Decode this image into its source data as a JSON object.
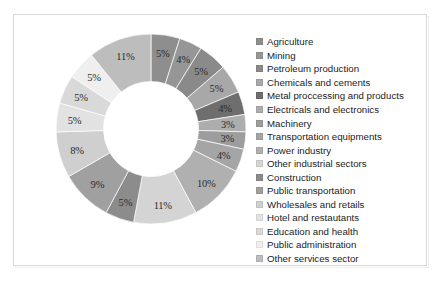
{
  "chart_data": {
    "type": "pie",
    "variant": "donut",
    "title": "",
    "xlabel": "",
    "ylabel": "",
    "legend_position": "right",
    "grid": false,
    "start_angle_deg": 0,
    "direction": "clockwise",
    "inner_radius_ratio": 0.5,
    "value_suffix": "%",
    "categories": [
      "Agriculture",
      "Mining",
      "Petroleum production",
      "Chemicals and cements",
      "Metal proccessing and products",
      "Electricals and electronics",
      "Machinery",
      "Transportation equipments",
      "Power industry",
      "Other industrial sectors",
      "Construction",
      "Public transportation",
      "Wholesales and retails",
      "Hotel and restautants",
      "Education and health",
      "Public administration",
      "Other services sector"
    ],
    "values": [
      5,
      4,
      5,
      5,
      4,
      3,
      3,
      4,
      10,
      11,
      5,
      9,
      8,
      5,
      5,
      5,
      11
    ],
    "labels": [
      "5%",
      "4%",
      "5%",
      "5%",
      "4%",
      "3%",
      "3%",
      "4%",
      "10%",
      "11%",
      "5%",
      "9%",
      "8%",
      "5%",
      "5%",
      "5%",
      "11%"
    ],
    "colors": [
      "#8e8e8e",
      "#969696",
      "#8a8a8a",
      "#a8a8a8",
      "#6e6e6e",
      "#adadad",
      "#9d9d9d",
      "#a5a5a5",
      "#b0b0b0",
      "#d4d4d4",
      "#8c8c8c",
      "#a0a0a0",
      "#cfcfcf",
      "#e2e2e2",
      "#d9d9d9",
      "#efefef",
      "#bdbdbd"
    ]
  },
  "legend": {
    "items": [
      {
        "label": "Agriculture",
        "color": "#8e8e8e"
      },
      {
        "label": "Mining",
        "color": "#969696"
      },
      {
        "label": "Petroleum production",
        "color": "#8a8a8a"
      },
      {
        "label": "Chemicals and cements",
        "color": "#a8a8a8"
      },
      {
        "label": "Metal proccessing and products",
        "color": "#6e6e6e"
      },
      {
        "label": "Electricals and electronics",
        "color": "#adadad"
      },
      {
        "label": "Machinery",
        "color": "#9d9d9d"
      },
      {
        "label": "Transportation equipments",
        "color": "#a5a5a5"
      },
      {
        "label": "Power industry",
        "color": "#b0b0b0"
      },
      {
        "label": "Other industrial sectors",
        "color": "#d4d4d4"
      },
      {
        "label": "Construction",
        "color": "#8c8c8c"
      },
      {
        "label": "Public transportation",
        "color": "#a0a0a0"
      },
      {
        "label": "Wholesales and retails",
        "color": "#cfcfcf"
      },
      {
        "label": "Hotel and restautants",
        "color": "#e2e2e2"
      },
      {
        "label": "Education and health",
        "color": "#d9d9d9"
      },
      {
        "label": "Public administration",
        "color": "#efefef"
      },
      {
        "label": "Other services sector",
        "color": "#bdbdbd"
      }
    ]
  }
}
